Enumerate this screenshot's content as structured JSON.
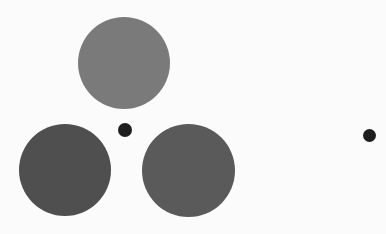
{
  "canvas": {
    "width": 386,
    "height": 234,
    "background": "#fbfbfb"
  },
  "shapes": [
    {
      "id": "top-disk",
      "cx": 124,
      "cy": 63,
      "d": 92,
      "color": "#7a7a7a"
    },
    {
      "id": "bottom-left-disk",
      "cx": 65,
      "cy": 170,
      "d": 92,
      "color": "#4f4f4f"
    },
    {
      "id": "bottom-right-disk",
      "cx": 188,
      "cy": 170,
      "d": 93,
      "color": "#5a5a5a"
    },
    {
      "id": "center-fixation-dot",
      "cx": 125,
      "cy": 130,
      "d": 14,
      "color": "#1e1e1e"
    },
    {
      "id": "right-fixation-dot",
      "cx": 369,
      "cy": 135,
      "d": 13,
      "color": "#1e1e1e"
    }
  ]
}
